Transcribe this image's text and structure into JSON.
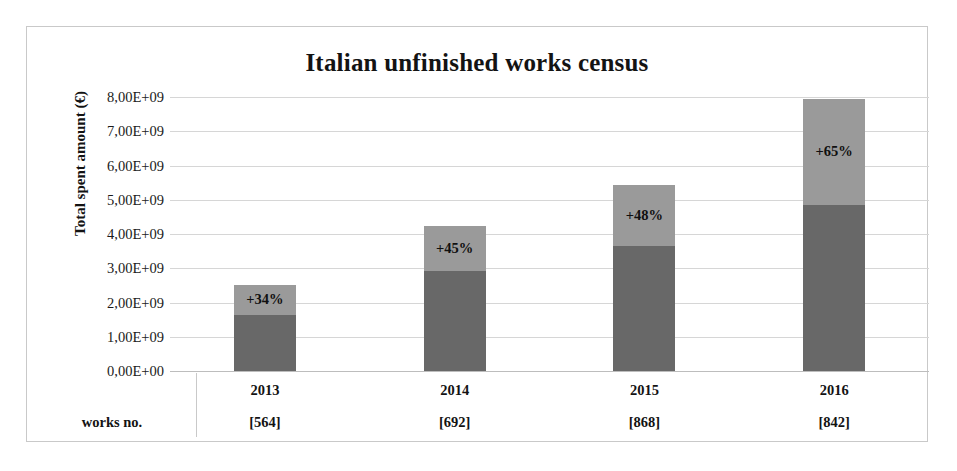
{
  "chart_data": {
    "type": "bar",
    "title": "Italian unfinished works census",
    "xlabel": "",
    "ylabel": "Total spent amount (€)",
    "ylim": [
      0,
      8000000000
    ],
    "grid": true,
    "legend": "none",
    "stacked": true,
    "categories": [
      "2013",
      "2014",
      "2015",
      "2016"
    ],
    "ytick_labels": [
      "8,00E+09",
      "7,00E+09",
      "6,00E+09",
      "5,00E+09",
      "4,00E+09",
      "3,00E+09",
      "2,00E+09",
      "1,00E+09",
      "0,00E+00"
    ],
    "ytick_values": [
      8000000000,
      7000000000,
      6000000000,
      5000000000,
      4000000000,
      3000000000,
      2000000000,
      1000000000,
      0
    ],
    "series": [
      {
        "name": "lower segment",
        "color": "#686868",
        "values": [
          1650000000,
          2920000000,
          3650000000,
          4850000000
        ]
      },
      {
        "name": "upper segment",
        "color": "#9a9a9a",
        "values": [
          850000000,
          1310000000,
          1770000000,
          3100000000
        ]
      }
    ],
    "totals": [
      2500000000,
      4230000000,
      5420000000,
      7950000000
    ],
    "annotations": [
      "+34%",
      "+45%",
      "+48%",
      "+65%"
    ],
    "works_no_header": "works no.",
    "works_no_values": [
      "[564]",
      "[692]",
      "[868]",
      "[842]"
    ]
  },
  "colors": {
    "segment_lower": "#686868",
    "segment_upper": "#9a9a9a",
    "gridline": "#d6d6d6",
    "frame_border": "#c9c9c9",
    "text": "#131313",
    "background": "#ffffff"
  }
}
